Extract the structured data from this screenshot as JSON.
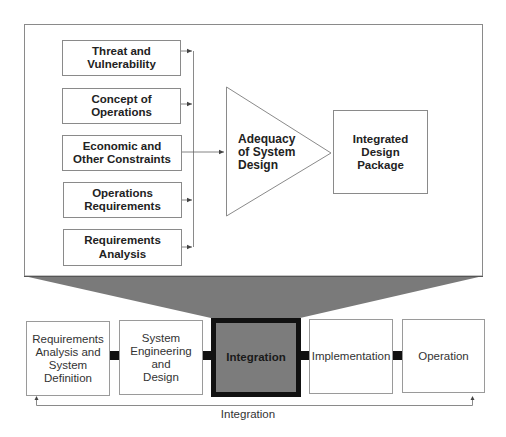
{
  "detail_panel": {
    "inputs": [
      {
        "id": "threat",
        "label": "Threat and\nVulnerability"
      },
      {
        "id": "conops",
        "label": "Concept of\nOperations"
      },
      {
        "id": "economic",
        "label": "Economic and\nOther Constraints"
      },
      {
        "id": "ops-req",
        "label": "Operations\nRequirements"
      },
      {
        "id": "req-analysis",
        "label": "Requirements\nAnalysis"
      }
    ],
    "process": {
      "label": "Adequacy\nof System\nDesign",
      "shape": "triangle"
    },
    "output": {
      "label": "Integrated\nDesign\nPackage"
    }
  },
  "lifecycle": {
    "stages": [
      {
        "id": "req-analysis-def",
        "label": "Requirements\nAnalysis and\nSystem\nDefinition",
        "active": false
      },
      {
        "id": "sys-eng-design",
        "label": "System\nEngineering\nand\nDesign",
        "active": false
      },
      {
        "id": "integration",
        "label": "Integration",
        "active": true
      },
      {
        "id": "implementation",
        "label": "Implementation",
        "active": false
      },
      {
        "id": "operation",
        "label": "Operation",
        "active": false
      }
    ],
    "feedback_label": "Integration"
  },
  "colors": {
    "line": "#8a8a8a",
    "funnel_fill": "#7a7a7a",
    "active_fill": "#7c7c7c",
    "active_border": "#111111",
    "connector": "#111111"
  }
}
